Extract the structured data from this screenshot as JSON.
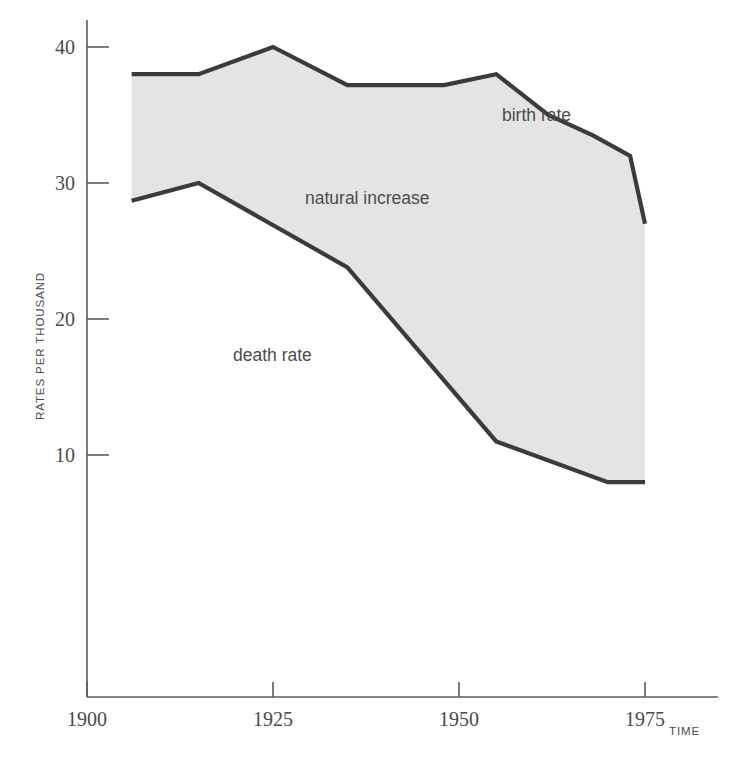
{
  "chart_data": {
    "type": "area",
    "title": "",
    "subtitle": "",
    "xlabel": "TIME",
    "ylabel": "RATES PER THOUSAND",
    "xlim": [
      1900,
      1985
    ],
    "ylim": [
      0,
      42
    ],
    "x_ticks": [
      1900,
      1925,
      1950,
      1975
    ],
    "x_tick_labels": [
      "1900",
      "1925",
      "1950",
      "1975"
    ],
    "y_ticks": [
      10,
      20,
      30,
      40
    ],
    "y_tick_labels": [
      "10",
      "20",
      "30",
      "40"
    ],
    "grid": false,
    "legend_position": "inline-annotations",
    "fill_color": "#e4e4e4",
    "line_color": "#3b3b3b",
    "axis_color": "#5a5a5a",
    "annotations": [
      {
        "text": "birth rate",
        "x": 1963,
        "y": 35.5
      },
      {
        "text": "natural increase",
        "x": 1931,
        "y": 30.8
      },
      {
        "text": "death rate",
        "x": 1920,
        "y": 21.6
      }
    ],
    "series": [
      {
        "name": "birth rate",
        "x": [
          1906,
          1915,
          1925,
          1935,
          1948,
          1955,
          1962,
          1968,
          1973,
          1975
        ],
        "values": [
          38.0,
          38.0,
          40.0,
          37.2,
          37.2,
          38.0,
          35.0,
          33.5,
          32.0,
          27.0
        ]
      },
      {
        "name": "death rate",
        "x": [
          1906,
          1915,
          1935,
          1955,
          1970,
          1975
        ],
        "values": [
          28.7,
          30.0,
          23.8,
          11.0,
          8.0,
          8.0
        ]
      }
    ],
    "band": {
      "name": "natural increase",
      "upper_series": "birth rate",
      "lower_series": "death rate",
      "fill": "#e4e4e4"
    }
  }
}
